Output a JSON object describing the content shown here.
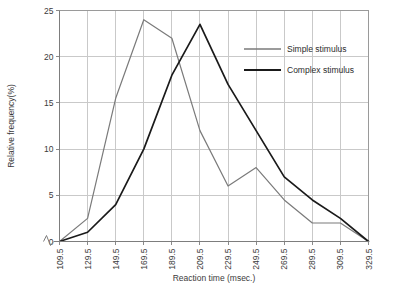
{
  "chart_data": {
    "type": "line",
    "title": "",
    "xlabel": "Reaction time (msec.)",
    "ylabel": "Relative frequency(%)",
    "categories": [
      "109.5",
      "129.5",
      "149.5",
      "169.5",
      "189.5",
      "209.5",
      "229.5",
      "249.5",
      "269.5",
      "289.5",
      "309.5",
      "329.5"
    ],
    "x": [
      109.5,
      129.5,
      149.5,
      169.5,
      189.5,
      209.5,
      229.5,
      249.5,
      269.5,
      289.5,
      309.5,
      329.5
    ],
    "series": [
      {
        "name": "Simple stimulus",
        "color": "#7a7a7a",
        "values": [
          0,
          2.5,
          15.5,
          24,
          22,
          12,
          6,
          8,
          4.5,
          2,
          2,
          0
        ]
      },
      {
        "name": "Complex stimulus",
        "color": "#1a1a1a",
        "values": [
          0,
          1,
          4,
          10,
          18,
          23.5,
          17,
          12,
          7,
          4.5,
          2.5,
          0
        ]
      }
    ],
    "ylim": [
      0,
      25
    ],
    "yticks": [
      0,
      5,
      10,
      15,
      20,
      25
    ],
    "yticklabels": [
      "0",
      "5",
      "10",
      "15",
      "20",
      "25"
    ],
    "xlim": [
      109.5,
      329.5
    ],
    "grid": true,
    "grid_color": "#c9c9c9",
    "legend_position": "upper right",
    "axis_break": true,
    "background": "#ffffff"
  },
  "legend": {
    "entries": [
      {
        "label": "Simple stimulus"
      },
      {
        "label": "Complex stimulus"
      }
    ]
  }
}
